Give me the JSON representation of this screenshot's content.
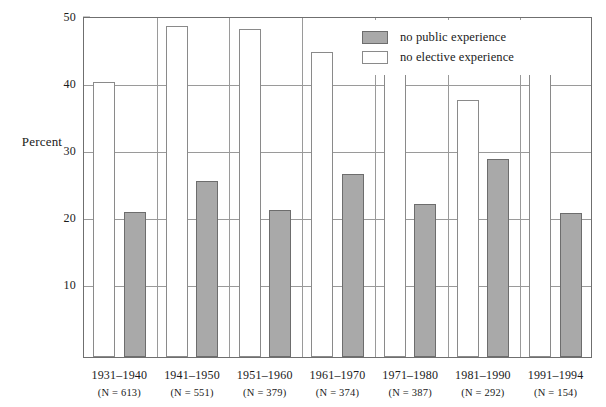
{
  "chart_data": {
    "type": "bar",
    "title": "",
    "xlabel": "",
    "ylabel": "Percent",
    "ylim": [
      0,
      50
    ],
    "yticks": [
      10,
      20,
      30,
      40,
      50
    ],
    "ytick_labels": [
      "10",
      "20",
      "30",
      "40",
      "50"
    ],
    "grid": true,
    "legend_position": "top-right inside plot",
    "categories": [
      "1931–1940",
      "1941–1950",
      "1951–1960",
      "1961–1970",
      "1971–1980",
      "1981–1990",
      "1991–1994"
    ],
    "category_sublabels": [
      "(N = 613)",
      "(N = 551)",
      "(N = 379)",
      "(N = 374)",
      "(N = 387)",
      "(N = 292)",
      "(N = 154)"
    ],
    "category_n": [
      613,
      551,
      379,
      374,
      387,
      292,
      154
    ],
    "series": [
      {
        "name": "no public experience",
        "color": "#a9a9a9",
        "edge_color": "#6d6d6d",
        "values": [
          20.7,
          25.4,
          21.0,
          26.4,
          22.0,
          28.7,
          20.6
        ]
      },
      {
        "name": "no elective experience",
        "color": "#ffffff",
        "edge_color": "#8a8a8a",
        "values": [
          40.2,
          48.5,
          48.0,
          44.6,
          41.8,
          37.4,
          46.5
        ]
      }
    ]
  },
  "axis": {
    "y_title": "Percent"
  },
  "legend": {
    "items": [
      {
        "label": "no public experience",
        "swatch": "public"
      },
      {
        "label": "no elective experience",
        "swatch": "elective"
      }
    ]
  }
}
